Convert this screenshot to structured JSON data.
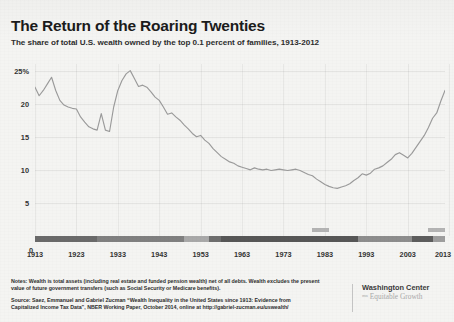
{
  "header": {
    "title": "The Return of the Roaring Twenties",
    "subtitle": "The share of total U.S. wealth owned by the top 0.1 percent of families, 1913-2012"
  },
  "footer": {
    "notes_line1": "Notes: Wealth is total assets (including real estate and funded pension wealth) net of all debts. Wealth excludes the present",
    "notes_line2": "value of future government transfers (such as Social Security or Medicare benefits).",
    "source_line1": "Source: Saez, Emmanuel and Gabriel Zucman “Wealth Inequality in the United States since 1913: Evidence from",
    "source_line2": "Capitalized Income Tax Data”, NBER Working Paper, October 2014, online at http://gabriel-zucman.eu/uswealth/"
  },
  "logo": {
    "line1": "Washington Center",
    "line2": "ᵐⁿ Equitable Growth"
  },
  "chart_data": {
    "type": "line",
    "title": "The Return of the Roaring Twenties",
    "subtitle": "The share of total U.S. wealth owned by the top 0.1 percent of families, 1913-2012",
    "xlabel": "",
    "ylabel": "",
    "xlim": [
      1913,
      2012
    ],
    "ylim": [
      0,
      26
    ],
    "grid": true,
    "legend": false,
    "line_color": "#9b9b9b",
    "y_ticks": [
      {
        "value": 25,
        "label": "25%"
      },
      {
        "value": 20,
        "label": "20"
      },
      {
        "value": 15,
        "label": "15"
      },
      {
        "value": 10,
        "label": "10"
      },
      {
        "value": 5,
        "label": "5"
      },
      {
        "value": 0,
        "label": "0"
      }
    ],
    "x_ticks": [
      1913,
      1923,
      1933,
      1943,
      1953,
      1963,
      1973,
      1983,
      1993,
      2003,
      2013
    ],
    "series": [
      {
        "name": "Top 0.1% share of total U.S. wealth",
        "x": [
          1913,
          1914,
          1915,
          1916,
          1917,
          1918,
          1919,
          1920,
          1921,
          1922,
          1923,
          1924,
          1925,
          1926,
          1927,
          1928,
          1929,
          1930,
          1931,
          1932,
          1933,
          1934,
          1935,
          1936,
          1937,
          1938,
          1939,
          1940,
          1941,
          1942,
          1943,
          1944,
          1945,
          1946,
          1947,
          1948,
          1949,
          1950,
          1951,
          1952,
          1953,
          1954,
          1955,
          1956,
          1957,
          1958,
          1959,
          1960,
          1961,
          1962,
          1963,
          1964,
          1965,
          1966,
          1967,
          1968,
          1969,
          1970,
          1971,
          1972,
          1973,
          1974,
          1975,
          1976,
          1977,
          1978,
          1979,
          1980,
          1981,
          1982,
          1983,
          1984,
          1985,
          1986,
          1987,
          1988,
          1989,
          1990,
          1991,
          1992,
          1993,
          1994,
          1995,
          1996,
          1997,
          1998,
          1999,
          2000,
          2001,
          2002,
          2003,
          2004,
          2005,
          2006,
          2007,
          2008,
          2009,
          2010,
          2011,
          2012
        ],
        "values": [
          22.5,
          21.2,
          22.0,
          23.0,
          24.0,
          22.0,
          20.5,
          19.8,
          19.5,
          19.3,
          19.2,
          18.0,
          17.2,
          16.5,
          16.2,
          16.0,
          18.5,
          16.0,
          15.8,
          19.5,
          22.0,
          23.5,
          24.5,
          25.0,
          23.8,
          22.6,
          22.8,
          22.5,
          21.8,
          21.0,
          20.5,
          19.5,
          18.4,
          18.6,
          18.0,
          17.5,
          16.8,
          16.2,
          15.5,
          15.0,
          15.2,
          14.5,
          14.0,
          13.2,
          12.6,
          12.0,
          11.6,
          11.2,
          11.0,
          10.6,
          10.4,
          10.2,
          10.0,
          10.3,
          10.1,
          10.0,
          10.1,
          9.9,
          10.0,
          10.1,
          10.0,
          9.9,
          10.0,
          10.1,
          9.9,
          9.6,
          9.3,
          9.1,
          8.6,
          8.2,
          7.8,
          7.5,
          7.3,
          7.2,
          7.4,
          7.6,
          7.9,
          8.4,
          8.8,
          9.4,
          9.2,
          9.5,
          10.1,
          10.3,
          10.6,
          11.1,
          11.6,
          12.3,
          12.6,
          12.2,
          11.8,
          12.5,
          13.4,
          14.3,
          15.2,
          16.4,
          17.8,
          18.6,
          20.4,
          22.0
        ]
      }
    ],
    "annotations": {
      "axis_bar_color": "#9a9a9a",
      "recession_marks": [
        {
          "start_year": 1980,
          "end_year": 1984
        },
        {
          "start_year": 2008,
          "end_year": 2012
        }
      ],
      "bar_segments": [
        {
          "start_year": 1913,
          "end_year": 1928,
          "shade": "#6a6a6a"
        },
        {
          "start_year": 1928,
          "end_year": 1949,
          "shade": "#808080"
        },
        {
          "start_year": 1949,
          "end_year": 1955,
          "shade": "#a9a9a9"
        },
        {
          "start_year": 1955,
          "end_year": 1958,
          "shade": "#6e6e6e"
        },
        {
          "start_year": 1958,
          "end_year": 1991,
          "shade": "#575757"
        },
        {
          "start_year": 1991,
          "end_year": 2004,
          "shade": "#8d8d8d"
        },
        {
          "start_year": 2004,
          "end_year": 2009,
          "shade": "#5d5d5d"
        },
        {
          "start_year": 2009,
          "end_year": 2012,
          "shade": "#9e9e9e"
        }
      ]
    }
  }
}
